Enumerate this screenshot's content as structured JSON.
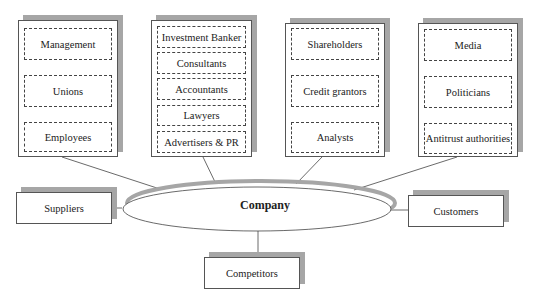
{
  "groups": [
    {
      "items": [
        "Management",
        "Unions",
        "Employees"
      ]
    },
    {
      "items": [
        "Investment Banker",
        "Consultants",
        "Accountants",
        "Lawyers",
        "Advertisers & PR"
      ]
    },
    {
      "items": [
        "Shareholders",
        "Credit grantors",
        "Analysts"
      ]
    },
    {
      "items": [
        "Media",
        "Politicians",
        "Antitrust authorities"
      ]
    }
  ],
  "center": {
    "label": "Company"
  },
  "side_boxes": {
    "left": "Suppliers",
    "right": "Customers",
    "bottom": "Competitors"
  },
  "colors": {
    "shadow": "#a6a6a6",
    "border": "#555555",
    "background": "#ffffff"
  }
}
